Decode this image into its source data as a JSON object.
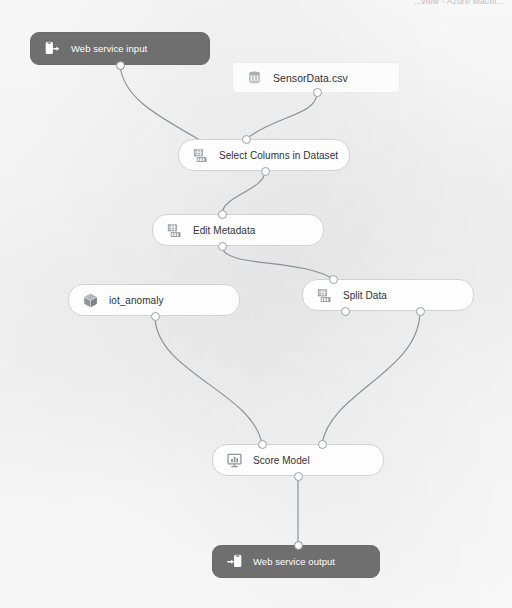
{
  "header": {
    "breadcrumb": "...view - Azure Machi..."
  },
  "canvas": {
    "background_color": "#fbfbfb",
    "wire_color": "#8a8f94",
    "node_border_color": "#cfd2d5",
    "node_fill_color": "#fdfdfd",
    "endpoint_fill_color": "#6f6f6f",
    "endpoint_text_color": "#ffffff"
  },
  "nodes": [
    {
      "id": "web-service-input",
      "label": "Web service input",
      "icon": "web-service-input-icon",
      "kind": "endpoint",
      "x": 30,
      "y": 32,
      "w": 180,
      "h": 33
    },
    {
      "id": "sensordata-csv",
      "label": "SensorData.csv",
      "icon": "dataset-icon",
      "kind": "dataset",
      "x": 232,
      "y": 62,
      "w": 168,
      "h": 31
    },
    {
      "id": "select-columns-in-dataset",
      "label": "Select Columns in Dataset",
      "icon": "data-transformation-icon",
      "kind": "module",
      "x": 178,
      "y": 139,
      "w": 172,
      "h": 32
    },
    {
      "id": "edit-metadata",
      "label": "Edit Metadata",
      "icon": "data-transformation-icon",
      "kind": "module",
      "x": 152,
      "y": 214,
      "w": 172,
      "h": 32
    },
    {
      "id": "iot-anomaly",
      "label": "iot_anomaly",
      "icon": "trained-model-icon",
      "kind": "model",
      "x": 68,
      "y": 284,
      "w": 172,
      "h": 32
    },
    {
      "id": "split-data",
      "label": "Split Data",
      "icon": "data-transformation-icon",
      "kind": "module",
      "x": 302,
      "y": 279,
      "w": 172,
      "h": 32
    },
    {
      "id": "score-model",
      "label": "Score Model",
      "icon": "score-model-icon",
      "kind": "module",
      "x": 212,
      "y": 444,
      "w": 172,
      "h": 32
    },
    {
      "id": "web-service-output",
      "label": "Web service output",
      "icon": "web-service-output-icon",
      "kind": "endpoint",
      "x": 212,
      "y": 545,
      "w": 168,
      "h": 33
    }
  ],
  "connections": [
    {
      "from": "web-service-input",
      "to": "select-columns-in-dataset"
    },
    {
      "from": "sensordata-csv",
      "to": "select-columns-in-dataset"
    },
    {
      "from": "select-columns-in-dataset",
      "to": "edit-metadata"
    },
    {
      "from": "edit-metadata",
      "to": "split-data"
    },
    {
      "from": "iot-anomaly",
      "to": "score-model"
    },
    {
      "from": "split-data",
      "to": "score-model"
    },
    {
      "from": "score-model",
      "to": "web-service-output"
    }
  ]
}
